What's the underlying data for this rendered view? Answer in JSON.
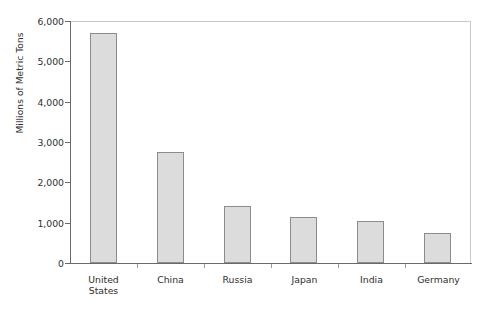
{
  "chart_data": {
    "type": "bar",
    "title": "",
    "subtitle": "",
    "xlabel": "",
    "ylabel": "Millions of Metric Tons",
    "categories": [
      "United\nStates",
      "China",
      "Russia",
      "Japan",
      "India",
      "Germany"
    ],
    "category_labels_flat": [
      "United States",
      "China",
      "Russia",
      "Japan",
      "India",
      "Germany"
    ],
    "values": [
      5700,
      2750,
      1420,
      1140,
      1040,
      745
    ],
    "ylim": [
      0,
      6000
    ],
    "yticks": [
      0,
      1000,
      2000,
      3000,
      4000,
      5000,
      6000
    ],
    "ytick_labels": [
      "0",
      "1,000",
      "2,000",
      "3,000",
      "4,000",
      "5,000",
      "6,000"
    ],
    "grid": false,
    "legend": false,
    "legend_position": "none",
    "bar_fill_color": "#dcdcdc",
    "bar_border_color": "#8c8c8c",
    "axis_color": "#6a6a6a",
    "frame_color": "#c9c9c9",
    "background_color": "#ffffff",
    "text_color": "#2e2e2e"
  }
}
